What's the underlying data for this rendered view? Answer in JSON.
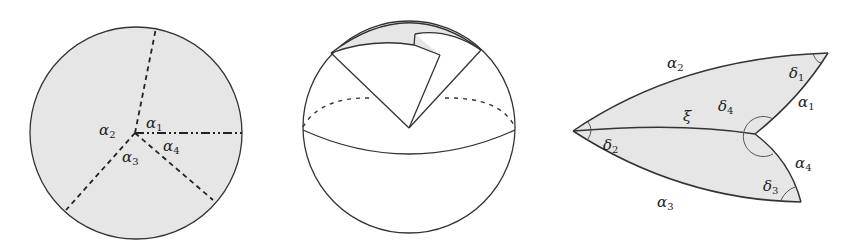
{
  "figure": {
    "panels": [
      {
        "id": "disk",
        "description": "Shaded disk with four rays from an interior point",
        "labels": {
          "a1": {
            "sym": "α",
            "sub": "1"
          },
          "a2": {
            "sym": "α",
            "sub": "2"
          },
          "a3": {
            "sym": "α",
            "sub": "3"
          },
          "a4": {
            "sym": "α",
            "sub": "4"
          }
        },
        "ray_styles": [
          "dashed",
          "dashed",
          "dashed",
          "dash-dot"
        ]
      },
      {
        "id": "sphere",
        "description": "Sphere with equator and a folded spherical polygon cut near the north pole"
      },
      {
        "id": "lens",
        "description": "Two spherical triangles joined along edge xi with angles delta",
        "labels": {
          "a1": {
            "sym": "α",
            "sub": "1"
          },
          "a2": {
            "sym": "α",
            "sub": "2"
          },
          "a3": {
            "sym": "α",
            "sub": "3"
          },
          "a4": {
            "sym": "α",
            "sub": "4"
          },
          "d1": {
            "sym": "δ",
            "sub": "1"
          },
          "d2": {
            "sym": "δ",
            "sub": "2"
          },
          "d3": {
            "sym": "δ",
            "sub": "3"
          },
          "d4": {
            "sym": "δ",
            "sub": "4"
          },
          "xi": {
            "sym": "ξ",
            "sub": ""
          }
        }
      }
    ],
    "colors": {
      "fill": "#e6e6e6",
      "stroke": "#333333",
      "background": "#ffffff"
    }
  }
}
